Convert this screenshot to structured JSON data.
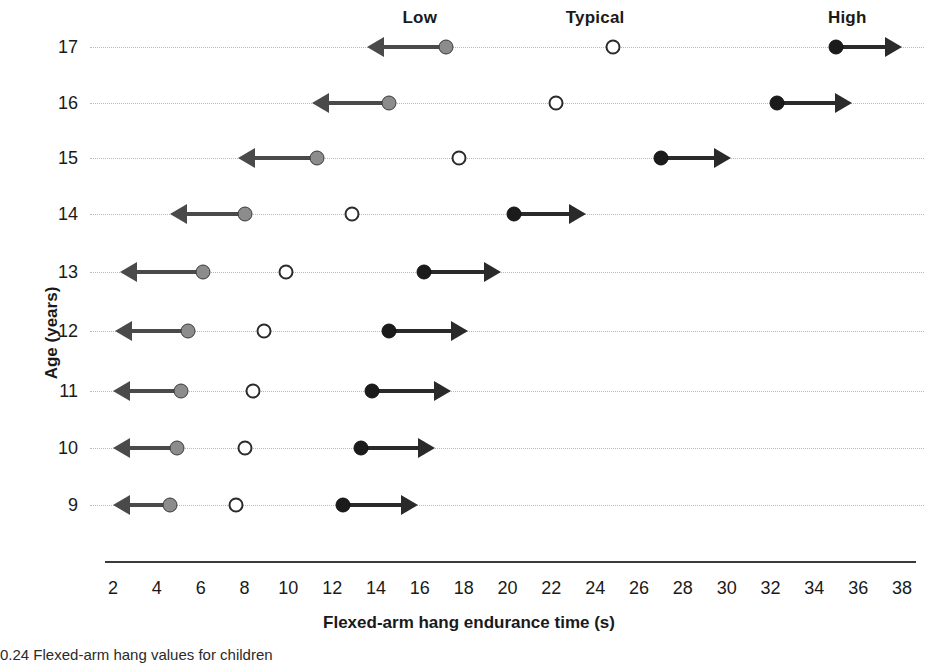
{
  "chart_data": {
    "type": "scatter",
    "title": "",
    "xlabel": "Flexed-arm hang endurance time (s)",
    "ylabel": "Age (years)",
    "xlim": [
      2,
      38
    ],
    "xticks": [
      2,
      4,
      6,
      8,
      10,
      12,
      14,
      16,
      18,
      20,
      22,
      24,
      26,
      28,
      30,
      32,
      34,
      36,
      38
    ],
    "grid": true,
    "legend_position": "top",
    "group_labels": [
      {
        "name": "Low",
        "value": 16.0
      },
      {
        "name": "Typical",
        "value": 24.0
      },
      {
        "name": "High",
        "value": 35.5
      }
    ],
    "categories": [
      "17",
      "16",
      "15",
      "14",
      "13",
      "12",
      "11",
      "10",
      "9"
    ],
    "series": [
      {
        "name": "Low",
        "marker": "filled-grey-circle",
        "arrow": "left",
        "values": [
          17.2,
          14.6,
          11.3,
          8.0,
          6.1,
          5.4,
          5.1,
          4.9,
          4.6
        ],
        "arrow_ends": [
          13.6,
          11.1,
          7.7,
          4.6,
          2.3,
          2.1,
          2.0,
          2.0,
          2.0
        ]
      },
      {
        "name": "Typical",
        "marker": "open-circle",
        "arrow": "none",
        "values": [
          24.8,
          22.2,
          17.8,
          12.9,
          9.9,
          8.9,
          8.4,
          8.0,
          7.6
        ],
        "arrow_ends": [
          null,
          null,
          null,
          null,
          null,
          null,
          null,
          null,
          null
        ]
      },
      {
        "name": "High",
        "marker": "filled-black-circle",
        "arrow": "right",
        "values": [
          35.0,
          32.3,
          27.0,
          20.3,
          16.2,
          14.6,
          13.8,
          13.3,
          12.5
        ],
        "arrow_ends": [
          38.0,
          35.7,
          30.2,
          23.6,
          19.7,
          18.2,
          17.4,
          16.7,
          15.9
        ]
      }
    ],
    "colors": {
      "low_marker": "#8c8c8c",
      "typical_marker": "#ffffff",
      "high_marker": "#1b1b1b",
      "low_arrow": "#4a4a4a",
      "high_arrow": "#2a2a2a",
      "gridline": "#b9b9b9",
      "axis": "#3a3a3a"
    }
  },
  "caption": "0.24   Flexed-arm hang values for children"
}
